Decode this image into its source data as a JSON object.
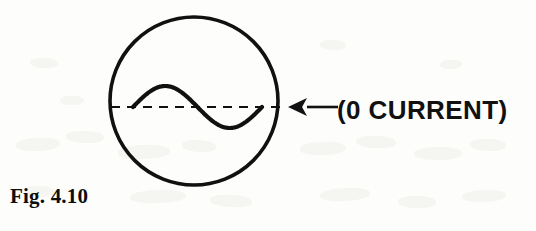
{
  "figure": {
    "caption": "Fig. 4.10",
    "annotation_label": "(0 CURRENT)",
    "colors": {
      "ink": "#111111",
      "paper": "#fdfdfc",
      "ghost": "#f2f1ef"
    },
    "elements": {
      "screen_circle": {
        "name": "oscilloscope-screen-outline",
        "center_x": 194,
        "center_y": 101,
        "radius": 84,
        "stroke_width": 3.6
      },
      "baseline": {
        "name": "zero-current-dashed-baseline",
        "y": 107,
        "x_start": 111,
        "x_end": 285,
        "dash": "9 7",
        "stroke_width": 2.2
      },
      "sine_trace": {
        "name": "sine-wave-trace",
        "x_start": 133,
        "x_end": 262,
        "baseline_y": 107,
        "crest_y": 86,
        "trough_y": 130,
        "amplitude": 21,
        "cycles": 1,
        "stroke_width": 4.2
      },
      "pointer_arrow": {
        "name": "annotation-arrow",
        "direction": "left",
        "tip_x": 288,
        "tail_x": 338,
        "y": 107,
        "head_length": 19,
        "head_half_height": 9,
        "stroke_width": 2.6
      },
      "annotation_text": {
        "x": 337,
        "baseline_y": 118
      },
      "caption": {
        "x": 10,
        "baseline_y": 203
      }
    },
    "ghost_blots": [
      {
        "left": 16,
        "top": 138,
        "width": 44,
        "height": 13,
        "rotate": -3
      },
      {
        "left": 66,
        "top": 131,
        "width": 38,
        "height": 12,
        "rotate": 2
      },
      {
        "left": 118,
        "top": 145,
        "width": 52,
        "height": 14,
        "rotate": -2
      },
      {
        "left": 182,
        "top": 140,
        "width": 34,
        "height": 12,
        "rotate": 4
      },
      {
        "left": 300,
        "top": 142,
        "width": 46,
        "height": 13,
        "rotate": -2
      },
      {
        "left": 356,
        "top": 136,
        "width": 40,
        "height": 12,
        "rotate": 3
      },
      {
        "left": 414,
        "top": 147,
        "width": 48,
        "height": 13,
        "rotate": -1
      },
      {
        "left": 470,
        "top": 139,
        "width": 36,
        "height": 12,
        "rotate": 2
      },
      {
        "left": 24,
        "top": 186,
        "width": 30,
        "height": 11,
        "rotate": 2
      },
      {
        "left": 130,
        "top": 190,
        "width": 56,
        "height": 13,
        "rotate": -2
      },
      {
        "left": 210,
        "top": 195,
        "width": 42,
        "height": 12,
        "rotate": 3
      },
      {
        "left": 320,
        "top": 188,
        "width": 50,
        "height": 13,
        "rotate": -3
      },
      {
        "left": 398,
        "top": 196,
        "width": 38,
        "height": 12,
        "rotate": 1
      },
      {
        "left": 462,
        "top": 190,
        "width": 44,
        "height": 12,
        "rotate": -2
      },
      {
        "left": 320,
        "top": 40,
        "width": 26,
        "height": 10,
        "rotate": 2
      },
      {
        "left": 440,
        "top": 60,
        "width": 22,
        "height": 9,
        "rotate": -2
      },
      {
        "left": 30,
        "top": 58,
        "width": 28,
        "height": 10,
        "rotate": 3
      },
      {
        "left": 60,
        "top": 96,
        "width": 24,
        "height": 9,
        "rotate": -1
      }
    ]
  }
}
